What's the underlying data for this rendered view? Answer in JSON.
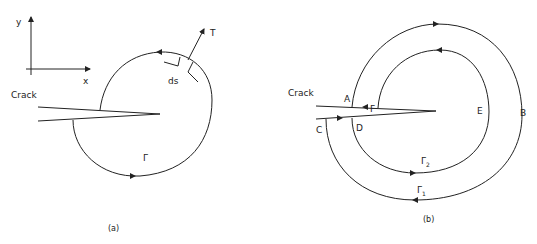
{
  "figure": {
    "panel_a": {
      "caption": "(a)",
      "axis_x_label": "x",
      "axis_y_label": "y",
      "crack_label": "Crack",
      "contour_label": "Γ",
      "traction_label": "T",
      "element_label": "ds"
    },
    "panel_b": {
      "caption": "(b)",
      "crack_label": "Crack",
      "points": {
        "A": "A",
        "B": "B",
        "C": "C",
        "D": "D",
        "E": "E",
        "F": "F"
      },
      "outer_contour_label": "Γ",
      "outer_contour_sub": "1",
      "inner_contour_label": "Γ",
      "inner_contour_sub": "2"
    }
  }
}
